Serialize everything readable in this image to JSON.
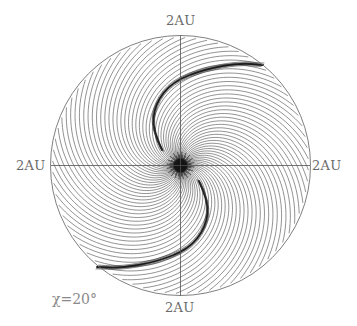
{
  "chart_data": {
    "type": "line",
    "title": "",
    "annotation": "χ=20°",
    "axis_labels": {
      "top": "2AU",
      "bottom": "2AU",
      "left": "2AU",
      "right": "2AU"
    },
    "axis_range_AU": [
      -2,
      2
    ],
    "grid": false,
    "geometry": {
      "center": [
        180.5,
        165.5
      ],
      "radius": 130
    },
    "spiral": {
      "count": 72,
      "k_per_px": 0.018,
      "r_min": 2,
      "r_max_fraction": 0.985,
      "stroke": "#4a4a4a",
      "stroke_width": 0.6
    },
    "crescent_upper": [
      [
        162,
        150
      ],
      [
        152,
        130
      ],
      [
        155,
        104
      ],
      [
        172,
        82
      ],
      [
        205,
        69
      ],
      [
        240,
        63
      ],
      [
        263,
        65
      ]
    ],
    "crescent_lower": [
      [
        199,
        181
      ],
      [
        209,
        201
      ],
      [
        206,
        227
      ],
      [
        189,
        249
      ],
      [
        156,
        262
      ],
      [
        121,
        268
      ],
      [
        97,
        267
      ]
    ],
    "crescent_color": "#1a1a1a",
    "colors": {
      "circle": "#707070",
      "axes": "#505050",
      "hub": "#111111"
    }
  }
}
